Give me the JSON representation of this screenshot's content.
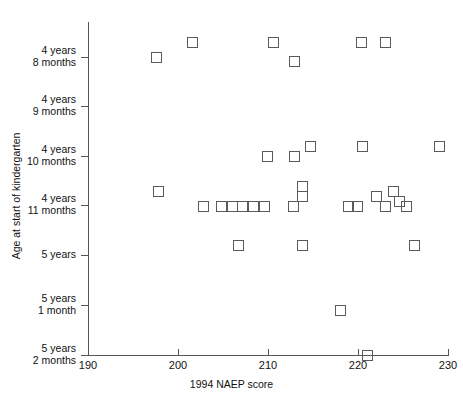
{
  "chart_data": {
    "type": "scatter",
    "title": "",
    "xlabel": "1994 NAEP score",
    "ylabel": "Age at start of kindergarten",
    "xlim": [
      190,
      230
    ],
    "xticks": [
      190,
      200,
      210,
      220,
      230
    ],
    "xtick_labels": [
      "190",
      "200",
      "210",
      "220",
      "230"
    ],
    "yticks": [
      56,
      57,
      58,
      59,
      60,
      61,
      62
    ],
    "ytick_labels": [
      "4 years\n8 months",
      "4 years\n9 months",
      "4 years\n10 months",
      "4 years\n11 months",
      "5 years",
      "5 years\n1 month",
      "5 years\n2 months"
    ],
    "ylim_months": [
      55.3,
      62.3
    ],
    "grid": false,
    "legend": null,
    "marker": "open-square",
    "points": [
      {
        "x": 197.6,
        "y": 56.0
      },
      {
        "x": 201.6,
        "y": 55.7
      },
      {
        "x": 210.6,
        "y": 55.7
      },
      {
        "x": 212.9,
        "y": 56.1
      },
      {
        "x": 220.4,
        "y": 55.7
      },
      {
        "x": 223.1,
        "y": 55.7
      },
      {
        "x": 209.9,
        "y": 58.0
      },
      {
        "x": 212.9,
        "y": 58.0
      },
      {
        "x": 214.7,
        "y": 57.8
      },
      {
        "x": 220.5,
        "y": 57.8
      },
      {
        "x": 229.1,
        "y": 57.8
      },
      {
        "x": 197.8,
        "y": 58.7
      },
      {
        "x": 202.8,
        "y": 59.0
      },
      {
        "x": 204.8,
        "y": 59.0
      },
      {
        "x": 206.0,
        "y": 59.0
      },
      {
        "x": 207.2,
        "y": 59.0
      },
      {
        "x": 208.4,
        "y": 59.0
      },
      {
        "x": 209.6,
        "y": 59.0
      },
      {
        "x": 212.8,
        "y": 59.0
      },
      {
        "x": 213.8,
        "y": 58.8
      },
      {
        "x": 213.8,
        "y": 58.6
      },
      {
        "x": 218.9,
        "y": 59.0
      },
      {
        "x": 219.9,
        "y": 59.0
      },
      {
        "x": 222.0,
        "y": 58.8
      },
      {
        "x": 223.0,
        "y": 59.0
      },
      {
        "x": 223.9,
        "y": 58.7
      },
      {
        "x": 224.6,
        "y": 58.9
      },
      {
        "x": 225.4,
        "y": 59.0
      },
      {
        "x": 206.7,
        "y": 59.8
      },
      {
        "x": 213.8,
        "y": 59.8
      },
      {
        "x": 226.3,
        "y": 59.8
      },
      {
        "x": 218.0,
        "y": 61.1
      },
      {
        "x": 221.1,
        "y": 62.0
      }
    ]
  },
  "axis": {
    "x_title": "1994 NAEP score",
    "y_title": "Age at start of kindergarten"
  }
}
